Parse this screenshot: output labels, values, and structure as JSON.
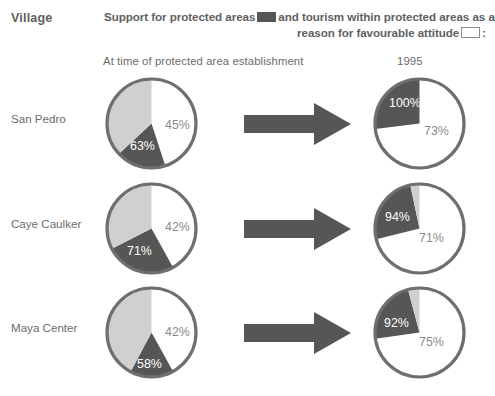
{
  "header": {
    "village_column_label": "Village",
    "legend_line1_before": "Support for protected areas",
    "legend_line1_after": "and",
    "legend_line1_tail": "tourism within protected areas as a",
    "legend_line2_before": "reason for favourable attitude",
    "legend_line2_after": ":",
    "swatch_support_color": "#565656",
    "swatch_tourism_color": "#ffffff"
  },
  "columns": {
    "left_subhead": "At time of protected area establishment",
    "right_subhead": "1995"
  },
  "colors": {
    "dark_gray": "#565656",
    "light_gray": "#d0d0d0",
    "white": "#ffffff",
    "outline": "#6f6f6f",
    "text": "#6b6b6b",
    "label_on_white": "#8a8a8a"
  },
  "rows": [
    {
      "village": "San Pedro",
      "before": {
        "support_label": "63%",
        "tourism_label": "45%",
        "slices": [
          {
            "name": "tourism",
            "color": "#ffffff",
            "start_deg": 0,
            "end_deg": 162
          },
          {
            "name": "support",
            "color": "#565656",
            "start_deg": 162,
            "end_deg": 227
          },
          {
            "name": "other",
            "color": "#d0d0d0",
            "start_deg": 227,
            "end_deg": 360
          }
        ],
        "label_positions": [
          {
            "text": "45%",
            "x": 62,
            "y": 54,
            "on": "white"
          },
          {
            "text": "63%",
            "x": 27,
            "y": 75,
            "on": "dark"
          }
        ]
      },
      "after": {
        "support_label": "100%",
        "tourism_label": "73%",
        "slices": [
          {
            "name": "tourism",
            "color": "#ffffff",
            "start_deg": 0,
            "end_deg": 263
          },
          {
            "name": "support",
            "color": "#565656",
            "start_deg": 263,
            "end_deg": 360
          }
        ],
        "label_positions": [
          {
            "text": "100%",
            "x": 18,
            "y": 32,
            "on": "dark"
          },
          {
            "text": "73%",
            "x": 53,
            "y": 60,
            "on": "white"
          }
        ]
      }
    },
    {
      "village": "Caye Caulker",
      "before": {
        "support_label": "71%",
        "tourism_label": "42%",
        "slices": [
          {
            "name": "tourism",
            "color": "#ffffff",
            "start_deg": 0,
            "end_deg": 151
          },
          {
            "name": "support",
            "color": "#565656",
            "start_deg": 151,
            "end_deg": 243
          },
          {
            "name": "other",
            "color": "#d0d0d0",
            "start_deg": 243,
            "end_deg": 360
          }
        ],
        "label_positions": [
          {
            "text": "42%",
            "x": 62,
            "y": 51,
            "on": "white"
          },
          {
            "text": "71%",
            "x": 24,
            "y": 75,
            "on": "dark"
          }
        ]
      },
      "after": {
        "support_label": "94%",
        "tourism_label": "71%",
        "slices": [
          {
            "name": "tourism",
            "color": "#ffffff",
            "start_deg": 0,
            "end_deg": 256
          },
          {
            "name": "support",
            "color": "#565656",
            "start_deg": 256,
            "end_deg": 348
          },
          {
            "name": "other",
            "color": "#d0d0d0",
            "start_deg": 348,
            "end_deg": 360
          }
        ],
        "label_positions": [
          {
            "text": "94%",
            "x": 14,
            "y": 41,
            "on": "dark"
          },
          {
            "text": "71%",
            "x": 48,
            "y": 62,
            "on": "white"
          }
        ]
      }
    },
    {
      "village": "Maya Center",
      "before": {
        "support_label": "58%",
        "tourism_label": "42%",
        "slices": [
          {
            "name": "tourism",
            "color": "#ffffff",
            "start_deg": 0,
            "end_deg": 151
          },
          {
            "name": "support",
            "color": "#565656",
            "start_deg": 151,
            "end_deg": 208
          },
          {
            "name": "other",
            "color": "#d0d0d0",
            "start_deg": 208,
            "end_deg": 360
          }
        ],
        "label_positions": [
          {
            "text": "42%",
            "x": 62,
            "y": 52,
            "on": "white"
          },
          {
            "text": "58%",
            "x": 34,
            "y": 84,
            "on": "dark"
          }
        ]
      },
      "after": {
        "support_label": "92%",
        "tourism_label": "75%",
        "slices": [
          {
            "name": "tourism",
            "color": "#ffffff",
            "start_deg": 0,
            "end_deg": 262
          },
          {
            "name": "support",
            "color": "#565656",
            "start_deg": 262,
            "end_deg": 345
          },
          {
            "name": "other",
            "color": "#d0d0d0",
            "start_deg": 345,
            "end_deg": 360
          }
        ],
        "label_positions": [
          {
            "text": "92%",
            "x": 13,
            "y": 43,
            "on": "dark"
          },
          {
            "text": "75%",
            "x": 48,
            "y": 62,
            "on": "white"
          }
        ]
      }
    }
  ],
  "chart_data": {
    "type": "pie",
    "categories": [
      "San Pedro",
      "Caye Caulker",
      "Maya Center"
    ],
    "time_points": [
      "At time of protected area establishment",
      "1995"
    ],
    "legend": [
      {
        "label": "Support for protected areas",
        "color": "#565656"
      },
      {
        "label": "tourism within protected areas as a reason for favourable attitude",
        "color": "#ffffff"
      }
    ],
    "series": [
      {
        "name": "Support for protected areas",
        "at_establishment": [
          63,
          71,
          58
        ],
        "in_1995": [
          100,
          94,
          92
        ]
      },
      {
        "name": "Tourism as reason for favourable attitude",
        "at_establishment": [
          45,
          42,
          42
        ],
        "in_1995": [
          73,
          71,
          75
        ]
      }
    ],
    "units": "percent",
    "grid": false,
    "legend_position": "top"
  }
}
